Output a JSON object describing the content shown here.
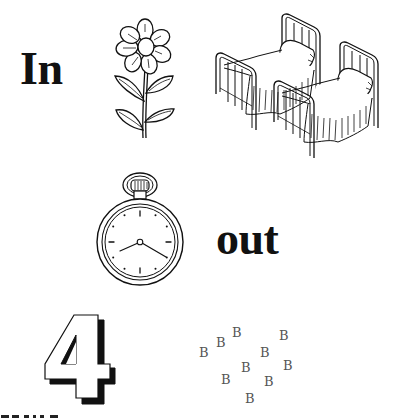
{
  "words": {
    "in": "In",
    "out": "out"
  },
  "pictures": [
    {
      "id": "flower",
      "label": "flower-icon"
    },
    {
      "id": "beds",
      "label": "twin-beds-icon",
      "count": 2
    },
    {
      "id": "pocket-watch",
      "label": "pocket-watch-icon"
    },
    {
      "id": "number-four",
      "label": "digit-four-icon",
      "value": "4"
    },
    {
      "id": "scattered-bs",
      "label": "letter-b-cluster",
      "letter": "B",
      "count": 10
    }
  ],
  "number": "4",
  "letters": [
    "B",
    "B",
    "B",
    "B",
    "B",
    "B",
    "B",
    "B",
    "B",
    "B"
  ],
  "colors": {
    "ink": "#111111",
    "letter_gray": "#555555",
    "background": "#ffffff"
  }
}
